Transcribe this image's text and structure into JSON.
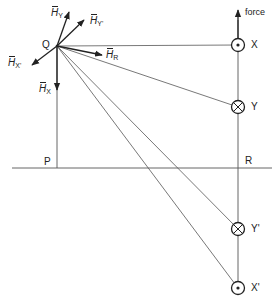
{
  "diagram": {
    "points": {
      "Q": "Q",
      "P": "P",
      "R": "R",
      "X": "X",
      "Y": "Y",
      "Y_prime": "Y'",
      "X_prime": "X'"
    },
    "vectors": {
      "H_Y": {
        "symbol": "H",
        "sub": "Y"
      },
      "H_Y_prime": {
        "symbol": "H",
        "sub": "Y'"
      },
      "H_X_prime": {
        "symbol": "H",
        "sub": "X'"
      },
      "H_R": {
        "symbol": "H",
        "sub": "R"
      },
      "H_X": {
        "symbol": "H",
        "sub": "X"
      }
    },
    "force_label": "force",
    "conductors": [
      {
        "name": "X",
        "current": "out-of-page (dot)"
      },
      {
        "name": "Y",
        "current": "into-page (cross)"
      },
      {
        "name": "Y'",
        "current": "into-page (cross)"
      },
      {
        "name": "X'",
        "current": "out-of-page (dot)"
      }
    ],
    "colors": {
      "ink": "#222222",
      "thin": "#555555",
      "background": "#ffffff"
    }
  }
}
